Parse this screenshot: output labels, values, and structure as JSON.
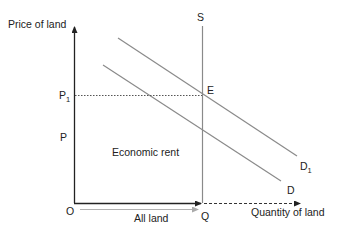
{
  "diagram": {
    "y_axis_label": "Price of land",
    "x_axis_label": "Quantity of land",
    "origin_label": "O",
    "supply_label": "S",
    "demand_label": "D",
    "demand_shifted_label": "D",
    "demand_shifted_subscript": "1",
    "equilibrium_label": "E",
    "price_label": "P",
    "price_new_label": "P",
    "price_new_subscript": "1",
    "quantity_label": "Q",
    "area_label": "Economic rent",
    "range_label": "All land"
  },
  "colors": {
    "axis": "#222222",
    "curve": "#8a8a8a",
    "guide": "#555555",
    "range_arrow": "#b0b0b0"
  }
}
